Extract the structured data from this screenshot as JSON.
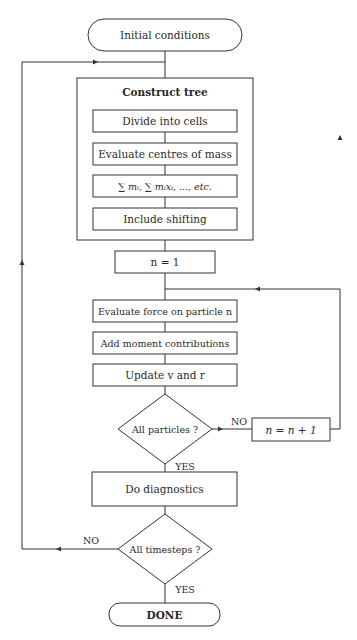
{
  "diagram": {
    "type": "flowchart",
    "nodes": {
      "start": {
        "label": "Initial conditions",
        "shape": "terminator"
      },
      "construct_tree": {
        "label": "Construct tree",
        "shape": "group"
      },
      "divide": {
        "label": "Divide into cells",
        "shape": "process"
      },
      "centres": {
        "label": "Evaluate centres of mass",
        "shape": "process"
      },
      "sums": {
        "label": "∑ mᵢ, ∑ mᵢxᵢ, ..., etc.",
        "shape": "process"
      },
      "shifting": {
        "label": "Include shifting",
        "shape": "process"
      },
      "init_n": {
        "label": "n = 1",
        "shape": "process"
      },
      "force": {
        "label": "Evaluate force on particle n",
        "shape": "process"
      },
      "moment": {
        "label": "Add moment contributions",
        "shape": "process"
      },
      "update": {
        "label": "Update v and r",
        "shape": "process"
      },
      "all_particles": {
        "label": "All particles ?",
        "shape": "decision"
      },
      "increment": {
        "label": "n = n + 1",
        "shape": "process"
      },
      "diagnostics": {
        "label": "Do diagnostics",
        "shape": "process"
      },
      "all_timesteps": {
        "label": "All timesteps ?",
        "shape": "decision"
      },
      "done": {
        "label": "DONE",
        "shape": "terminator"
      }
    },
    "edge_labels": {
      "particles_no": "NO",
      "particles_yes": "YES",
      "timesteps_no": "NO",
      "timesteps_yes": "YES"
    },
    "colors": {
      "stroke": "#333333",
      "text": "#2a2a2a",
      "background": "#ffffff"
    }
  }
}
